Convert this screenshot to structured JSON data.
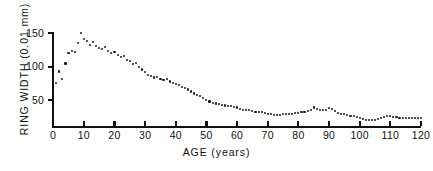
{
  "chart_data": {
    "type": "scatter",
    "title": "",
    "xlabel": "AGE  (years)",
    "ylabel": "RING WIDTH  (0.01 mm)",
    "xlim": [
      0,
      120
    ],
    "ylim": [
      10,
      160
    ],
    "grid": false,
    "legend": null,
    "xticks": [
      0,
      10,
      20,
      30,
      40,
      50,
      60,
      70,
      80,
      90,
      100,
      110,
      120
    ],
    "xtick_labels": [
      "0",
      "10",
      "20",
      "30",
      "40",
      "50",
      "60",
      "70",
      "80",
      "90",
      "100",
      "110",
      "120"
    ],
    "yticks": [
      50,
      100,
      150
    ],
    "ytick_labels": [
      "50",
      "100",
      "150"
    ],
    "marker": "dot",
    "marker_color": "#1a1a1a",
    "x": [
      1,
      2,
      3,
      4,
      5,
      6,
      7,
      8,
      9,
      10,
      11,
      12,
      13,
      14,
      15,
      16,
      17,
      18,
      19,
      20,
      21,
      22,
      23,
      24,
      25,
      26,
      27,
      28,
      29,
      30,
      31,
      32,
      33,
      34,
      35,
      36,
      37,
      38,
      39,
      40,
      41,
      42,
      43,
      44,
      45,
      46,
      47,
      48,
      49,
      50,
      51,
      52,
      53,
      54,
      55,
      56,
      57,
      58,
      59,
      60,
      61,
      62,
      63,
      64,
      65,
      66,
      67,
      68,
      69,
      70,
      71,
      72,
      73,
      74,
      75,
      76,
      77,
      78,
      79,
      80,
      81,
      82,
      83,
      84,
      85,
      86,
      87,
      88,
      89,
      90,
      91,
      92,
      93,
      94,
      95,
      96,
      97,
      98,
      99,
      100,
      101,
      102,
      103,
      104,
      105,
      106,
      107,
      108,
      109,
      110,
      111,
      112,
      113,
      114,
      115,
      116,
      117,
      118,
      119,
      120
    ],
    "y": [
      76,
      93,
      82,
      105,
      120,
      123,
      122,
      135,
      150,
      142,
      138,
      133,
      137,
      131,
      128,
      126,
      129,
      123,
      121,
      122,
      118,
      114,
      116,
      110,
      108,
      104,
      106,
      100,
      96,
      92,
      88,
      86,
      84,
      85,
      82,
      80,
      82,
      78,
      76,
      74,
      73,
      70,
      68,
      66,
      63,
      60,
      58,
      56,
      53,
      50,
      48,
      46,
      45,
      44,
      43,
      42,
      41,
      41,
      40,
      39,
      37,
      36,
      36,
      35,
      34,
      33,
      33,
      32,
      31,
      30,
      29,
      28,
      28,
      28,
      29,
      29,
      30,
      30,
      31,
      31,
      32,
      33,
      34,
      36,
      39,
      37,
      35,
      35,
      36,
      38,
      37,
      34,
      31,
      30,
      29,
      28,
      27,
      26,
      25,
      24,
      22,
      21,
      20,
      20,
      21,
      22,
      24,
      25,
      26,
      26,
      25,
      25,
      24,
      24,
      24,
      24,
      23,
      23,
      23,
      23
    ]
  },
  "axes": {
    "y_title": "RING WIDTH  (0.01 mm)",
    "x_title": "AGE  (years)"
  }
}
